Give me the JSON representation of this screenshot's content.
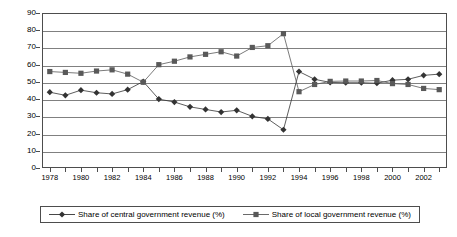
{
  "chart_data": {
    "type": "line",
    "title": "",
    "xlabel": "",
    "ylabel": "",
    "ylim": [
      0,
      90
    ],
    "ytick_step": 10,
    "grid": true,
    "legend_position": "bottom",
    "x": [
      1978,
      1979,
      1980,
      1981,
      1982,
      1983,
      1984,
      1985,
      1986,
      1987,
      1988,
      1989,
      1990,
      1991,
      1992,
      1993,
      1994,
      1995,
      1996,
      1997,
      1998,
      1999,
      2000,
      2001,
      2002,
      2003
    ],
    "xtick_labels": [
      "1978",
      "",
      "1980",
      "",
      "1982",
      "",
      "1984",
      "",
      "1986",
      "",
      "1988",
      "",
      "1990",
      "",
      "1992",
      "",
      "1994",
      "",
      "1996",
      "",
      "1998",
      "",
      "2000",
      "",
      "2002",
      ""
    ],
    "yticks": [
      0,
      10,
      20,
      30,
      40,
      50,
      60,
      70,
      80,
      90
    ],
    "series": [
      {
        "name": "Share of central government revenue (%)",
        "marker": "diamond",
        "color": "#333333",
        "values": [
          44.0,
          42.2,
          45.2,
          43.7,
          43.0,
          45.5,
          50.2,
          40.0,
          38.3,
          35.5,
          34.0,
          32.5,
          33.5,
          30.0,
          28.5,
          22.2,
          56.0,
          51.5,
          49.7,
          49.5,
          49.5,
          49.2,
          51.0,
          51.5,
          53.8,
          54.5
        ]
      },
      {
        "name": "Share of local government revenue (%)",
        "marker": "square",
        "color": "#595959",
        "values": [
          56.0,
          55.5,
          55.0,
          56.3,
          57.0,
          54.5,
          49.8,
          60.0,
          62.0,
          64.5,
          66.0,
          67.5,
          65.0,
          70.0,
          71.0,
          78.0,
          44.3,
          48.5,
          50.3,
          50.5,
          50.5,
          50.8,
          49.0,
          48.5,
          46.2,
          45.5
        ]
      }
    ]
  },
  "legend": {
    "entries": [
      {
        "label": "Share of central government revenue (%)",
        "marker": "diamond-marker-icon"
      },
      {
        "label": "Share of local government revenue (%)",
        "marker": "square-marker-icon"
      }
    ]
  }
}
